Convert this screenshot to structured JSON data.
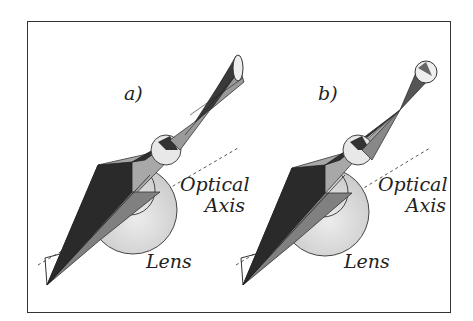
{
  "figure": {
    "panels": [
      {
        "id": "a",
        "label": "a)",
        "axis_label_line1": "Optical",
        "axis_label_line2": "Axis",
        "lens_label": "Lens"
      },
      {
        "id": "b",
        "label": "b)",
        "axis_label_line1": "Optical",
        "axis_label_line2": "Axis",
        "lens_label": "Lens"
      }
    ],
    "colors": {
      "frame": "#333333",
      "dark_fill": "#2a2a2a",
      "mid_fill": "#7a7a7a",
      "light_fill": "#bdbdbd",
      "lens_fill": "#d6d6d6",
      "stroke": "#222222"
    }
  }
}
